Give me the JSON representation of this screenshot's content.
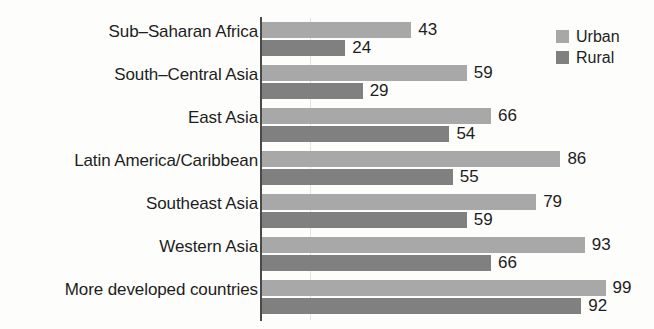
{
  "chart_data": {
    "type": "bar",
    "orientation": "horizontal",
    "title": "",
    "xlabel": "",
    "ylabel": "",
    "xlim": [
      0,
      100
    ],
    "grid": false,
    "legend_position": "top-right",
    "categories": [
      "Sub–Saharan Africa",
      "South–Central Asia",
      "East Asia",
      "Latin America/Caribbean",
      "Southeast Asia",
      "Western Asia",
      "More developed countries"
    ],
    "series": [
      {
        "name": "Urban",
        "color": "#a8a8a8",
        "values": [
          43,
          59,
          66,
          86,
          79,
          93,
          99
        ]
      },
      {
        "name": "Rural",
        "color": "#808080",
        "values": [
          24,
          29,
          54,
          55,
          59,
          66,
          92
        ]
      }
    ]
  },
  "legend": {
    "items": [
      {
        "label": "Urban",
        "swatch": "urban"
      },
      {
        "label": "Rural",
        "swatch": "rural"
      }
    ]
  }
}
